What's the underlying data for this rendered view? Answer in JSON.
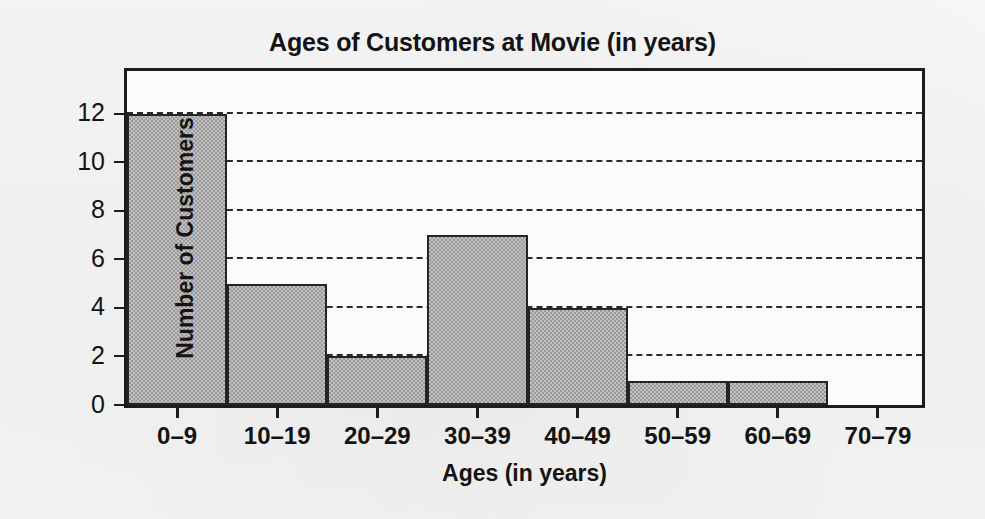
{
  "chart_data": {
    "type": "bar",
    "title": "Ages of Customers at Movie (in years)",
    "xlabel": "Ages (in years)",
    "ylabel": "Number of Customers",
    "categories": [
      "0–9",
      "10–19",
      "20–29",
      "30–39",
      "40–49",
      "50–59",
      "60–69",
      "70–79"
    ],
    "values": [
      12,
      5,
      2,
      7,
      4,
      1,
      1,
      0
    ],
    "ylim": [
      0,
      14
    ],
    "ytick_values": [
      0,
      2,
      4,
      6,
      8,
      10,
      12
    ],
    "ytick_labels": [
      "0",
      "2",
      "4",
      "6",
      "8",
      "10",
      "12"
    ],
    "gridlines": "horizontal-dashed",
    "grid": true,
    "legend": "none",
    "bar_style": "histogram-adjacent",
    "colors": {
      "bar_fill": "#a9a9a9",
      "bar_edge": "#242424",
      "gridline": "#2a2a2a",
      "axis": "#1c1c1c",
      "text": "#141414",
      "plot_background": "#fbfbfb",
      "page_background": "#f5f5f5"
    }
  }
}
